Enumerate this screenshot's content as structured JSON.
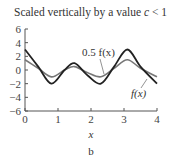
{
  "chart_data": {
    "type": "line",
    "title": "Scaled vertically by a value c < 1",
    "xlabel": "x",
    "ylabel": "",
    "panel_label": "b",
    "xlim": [
      0,
      4
    ],
    "ylim": [
      -6,
      6
    ],
    "xticks": [
      0,
      1,
      2,
      3,
      4
    ],
    "yticks": [
      6,
      4,
      2,
      0,
      -2,
      -4,
      -6
    ],
    "grid": false,
    "series": [
      {
        "name": "f(x)",
        "color": "#222222",
        "x": [
          0,
          0.4,
          0.8,
          1.2,
          1.5,
          1.9,
          2.3,
          2.7,
          3.1,
          3.5,
          4.0
        ],
        "y": [
          3,
          0.5,
          -2,
          0,
          1,
          -0.8,
          -2,
          0.5,
          3,
          0.5,
          -2
        ]
      },
      {
        "name": "0.5 f(x)",
        "color": "#777777",
        "x": [
          0,
          0.4,
          0.8,
          1.2,
          1.5,
          1.9,
          2.3,
          2.7,
          3.1,
          3.5,
          4.0
        ],
        "y": [
          1.5,
          0.25,
          -1,
          0,
          0.5,
          -0.4,
          -1,
          0.25,
          1.5,
          0.25,
          -1
        ]
      }
    ],
    "annotations": [
      {
        "text": "0.5 f(x)",
        "x": 1.9,
        "y": 1.5
      },
      {
        "text": "f(x)",
        "x": 3.5,
        "y": -3.5
      }
    ]
  },
  "title_prefix": "Scaled vertically by a value ",
  "title_var": "c",
  "title_suffix": " < 1",
  "xlabel": "x",
  "panel_label": "b",
  "annotation_half": "0.5 f(x)",
  "annotation_full": "f(x)"
}
